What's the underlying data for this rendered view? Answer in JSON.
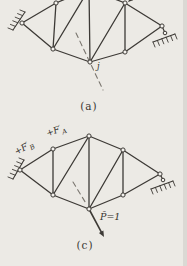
{
  "canvas": {
    "width": 187,
    "height": 266,
    "background": "#eceae5",
    "line_color": "#3d3a36",
    "dash_color": "#7a766f",
    "node_fill": "#f4f2ee"
  },
  "labels": {
    "joint_j": "j",
    "caption_a": "(a)",
    "caption_c": "(c)",
    "force_a": {
      "pre": "+F",
      "prime": "′",
      "sub": "A"
    },
    "force_b": {
      "pre": "+F",
      "prime": "′",
      "sub": "B"
    },
    "load": "P̄=1"
  },
  "diagrams": [
    {
      "name": "a",
      "nodes": {
        "SL": [
          22,
          23
        ],
        "T1": [
          56,
          3
        ],
        "T2": [
          89,
          -11
        ],
        "T3": [
          125,
          3
        ],
        "SR": [
          162,
          26
        ],
        "B1": [
          53,
          49
        ],
        "J": [
          90,
          62
        ],
        "B3": [
          125,
          52
        ]
      },
      "members": [
        [
          "SL",
          "T1"
        ],
        [
          "T1",
          "T2"
        ],
        [
          "T2",
          "T3"
        ],
        [
          "T3",
          "SR"
        ],
        [
          "SL",
          "B1"
        ],
        [
          "B1",
          "J"
        ],
        [
          "J",
          "B3"
        ],
        [
          "B3",
          "SR"
        ],
        [
          "T1",
          "B1"
        ],
        [
          "T3",
          "B3"
        ],
        [
          "B1",
          "T2"
        ],
        [
          "J",
          "T2"
        ],
        [
          "J",
          "T3"
        ]
      ],
      "circles": [
        "SL",
        "T1",
        "T3",
        "SR",
        "B1",
        "J",
        "B3"
      ],
      "dashed": [
        [
          76,
          33
        ],
        [
          103,
          90
        ]
      ],
      "arrows": [
        {
          "from": [
            137,
            -6
          ],
          "to": [
            128,
            2
          ],
          "w": 1.2,
          "head": 5
        }
      ],
      "supports": [
        {
          "pin": [
            22,
            23
          ],
          "ground": [
            [
              25,
              12
            ],
            [
              13,
              30
            ]
          ],
          "tick": [
            -5,
            -2
          ],
          "n": 6
        },
        {
          "pin": [
            165,
            33
          ],
          "attach": "SR",
          "ground": [
            [
              153,
              42
            ],
            [
              175,
              34
            ]
          ],
          "tick": [
            2,
            5
          ],
          "n": 6
        }
      ]
    },
    {
      "name": "c",
      "nodes": {
        "SL": [
          20,
          170
        ],
        "T1": [
          53,
          149
        ],
        "T2": [
          89,
          136
        ],
        "T3": [
          123,
          150
        ],
        "SR": [
          160,
          174
        ],
        "B1": [
          53,
          195
        ],
        "J": [
          89,
          209
        ],
        "B3": [
          123,
          195
        ]
      },
      "members": [
        [
          "SL",
          "T1"
        ],
        [
          "T1",
          "T2"
        ],
        [
          "T2",
          "T3"
        ],
        [
          "T3",
          "SR"
        ],
        [
          "SL",
          "B1"
        ],
        [
          "B1",
          "J"
        ],
        [
          "J",
          "B3"
        ],
        [
          "B3",
          "SR"
        ],
        [
          "T1",
          "B1"
        ],
        [
          "T3",
          "B3"
        ],
        [
          "B1",
          "T2"
        ],
        [
          "J",
          "T2"
        ],
        [
          "J",
          "T3"
        ]
      ],
      "circles": [
        "SL",
        "T1",
        "T2",
        "T3",
        "SR",
        "B1",
        "J",
        "B3"
      ],
      "dashed": [
        [
          73,
          182
        ],
        [
          87,
          205
        ]
      ],
      "arrows": [
        {
          "from": [
            89,
            209
          ],
          "to": [
            104,
            237
          ],
          "w": 1.6,
          "head": 6
        }
      ],
      "supports": [
        {
          "pin": [
            20,
            170
          ],
          "ground": [
            [
              24,
              160
            ],
            [
              13,
              179
            ]
          ],
          "tick": [
            -5,
            -2
          ],
          "n": 6
        },
        {
          "pin": [
            163,
            180
          ],
          "attach": "SR",
          "ground": [
            [
              151,
              189
            ],
            [
              173,
              181
            ]
          ],
          "tick": [
            2,
            5
          ],
          "n": 6
        }
      ]
    }
  ]
}
